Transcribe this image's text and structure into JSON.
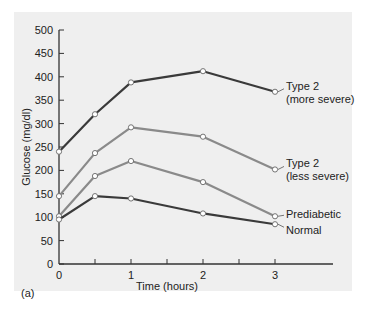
{
  "chart_data": {
    "type": "line",
    "title": "",
    "panel_label": "(a)",
    "xlabel": "Time (hours)",
    "ylabel": "Glucose (mg/dl)",
    "xlim": [
      0,
      3
    ],
    "ylim": [
      0,
      500
    ],
    "x_ticks": [
      0,
      0.5,
      1,
      1.5,
      2,
      2.5,
      3
    ],
    "x_tick_labels": [
      "0",
      "",
      "1",
      "",
      "2",
      "",
      "3"
    ],
    "y_ticks": [
      0,
      50,
      100,
      150,
      200,
      250,
      300,
      350,
      400,
      450,
      500
    ],
    "y_tick_labels": [
      "0",
      "50",
      "100",
      "150",
      "200",
      "250",
      "300",
      "350",
      "400",
      "450",
      "500"
    ],
    "grid": false,
    "legend_position": "inline-right",
    "x": [
      0,
      0.5,
      1,
      2,
      3
    ],
    "series": [
      {
        "name": "Type 2 (more severe)",
        "label_lines": [
          "Type 2",
          "(more severe)"
        ],
        "color": "#3a3a3a",
        "values": [
          240,
          320,
          388,
          412,
          368
        ]
      },
      {
        "name": "Type 2 (less severe)",
        "label_lines": [
          "Type 2",
          "(less severe)"
        ],
        "color": "#8a8a8a",
        "values": [
          145,
          237,
          292,
          272,
          202
        ]
      },
      {
        "name": "Prediabetic",
        "label_lines": [
          "Prediabetic"
        ],
        "color": "#8a8a8a",
        "values": [
          102,
          188,
          220,
          175,
          102
        ]
      },
      {
        "name": "Normal",
        "label_lines": [
          "Normal"
        ],
        "color": "#3a3a3a",
        "values": [
          95,
          145,
          140,
          108,
          85
        ]
      }
    ]
  }
}
